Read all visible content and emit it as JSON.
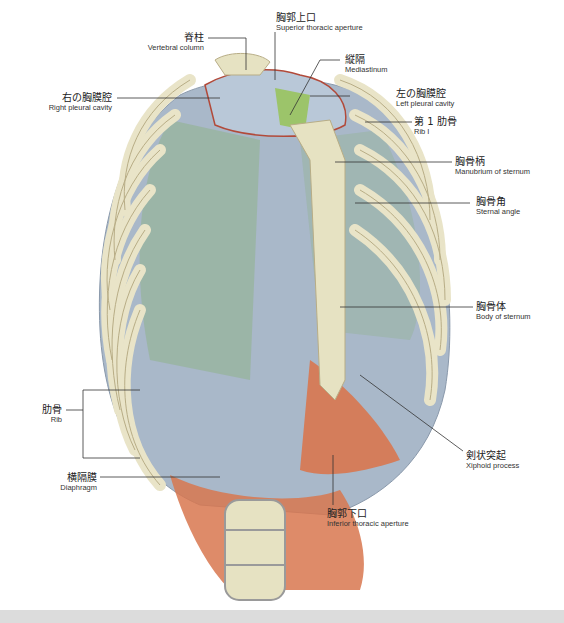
{
  "figure": {
    "colors": {
      "bone": "#e9e4c8",
      "bone_edge": "#b8ad86",
      "cartilage": "#b9c4d2",
      "intercostal": "#9fb0c4",
      "lung_green": "#8fb38a",
      "mediastinum_green": "#9cc46a",
      "diaphragm": "#d8774f",
      "pleura_line": "#b24a3a",
      "leader_line": "#333333"
    }
  },
  "labels": {
    "superior_aperture": {
      "jp": "胸郭上口",
      "en": "Superior thoracic aperture"
    },
    "vertebral_column": {
      "jp": "脊柱",
      "en": "Vertebral column"
    },
    "mediastinum": {
      "jp": "縦隔",
      "en": "Mediastinum"
    },
    "right_pleural": {
      "jp": "右の胸膜腔",
      "en": "Right pleural cavity"
    },
    "left_pleural": {
      "jp": "左の胸膜腔",
      "en": "Left pleural cavity"
    },
    "rib1": {
      "jp": "第 1 肋骨",
      "en": "Rib I"
    },
    "manubrium": {
      "jp": "胸骨柄",
      "en": "Manubrium of sternum"
    },
    "sternal_angle": {
      "jp": "胸骨角",
      "en": "Sternal angle"
    },
    "body_sternum": {
      "jp": "胸骨体",
      "en": "Body of sternum"
    },
    "rib": {
      "jp": "肋骨",
      "en": "Rib"
    },
    "xiphoid": {
      "jp": "剣状突起",
      "en": "Xiphoid process"
    },
    "diaphragm": {
      "jp": "横隔膜",
      "en": "Diaphragm"
    },
    "inferior_aperture": {
      "jp": "胸郭下口",
      "en": "Inferior thoracic aperture"
    }
  }
}
